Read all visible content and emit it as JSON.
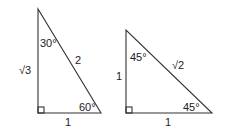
{
  "diagram": {
    "type": "special-right-triangles",
    "line_color": "#333333",
    "text_color": "#222222",
    "triangles": [
      {
        "name": "30-60-90",
        "vertices": {
          "top": [
            38,
            9
          ],
          "right_angle": [
            38,
            113
          ],
          "bottom_right": [
            101,
            113
          ]
        },
        "labels": {
          "top_angle": "30°",
          "vertical_side": "√3",
          "hypotenuse": "2",
          "bottom_angle": "60°",
          "base": "1"
        }
      },
      {
        "name": "45-45-90",
        "vertices": {
          "top": [
            126,
            30
          ],
          "right_angle": [
            126,
            113
          ],
          "bottom_right": [
            212,
            113
          ]
        },
        "labels": {
          "top_angle": "45°",
          "vertical_side": "1",
          "hypotenuse": "√2",
          "bottom_angle": "45°",
          "base": "1"
        }
      }
    ]
  }
}
